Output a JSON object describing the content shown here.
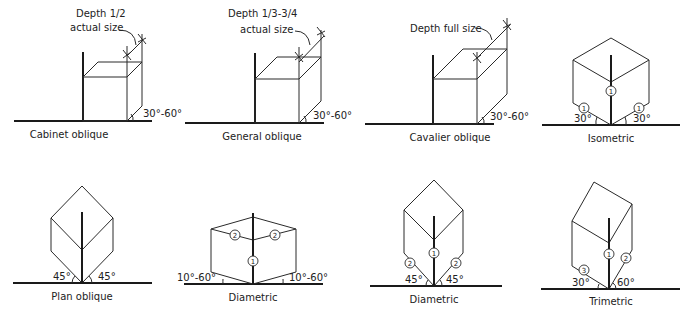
{
  "figures": [
    {
      "id": "cabinet",
      "caption": "Cabinet oblique",
      "note_line1": "Depth 1/2",
      "note_line2": "actual size",
      "angle": "30°-60°"
    },
    {
      "id": "general",
      "caption": "General oblique",
      "note_line1": "Depth 1/3-3/4",
      "note_line2": "actual size",
      "angle": "30°-60°"
    },
    {
      "id": "cavalier",
      "caption": "Cavalier oblique",
      "note_line1": "Depth full size",
      "angle": "30°-60°"
    },
    {
      "id": "isometric",
      "caption": "Isometric",
      "angle_left": "30°",
      "angle_right": "30°",
      "scale_vertical": "1",
      "scale_left": "1",
      "scale_right": "1"
    },
    {
      "id": "plan",
      "caption": "Plan oblique",
      "angle_left": "45°",
      "angle_right": "45°"
    },
    {
      "id": "diametric1",
      "caption": "Diametric",
      "angle_left": "10°-60°",
      "angle_right": "10°-60°",
      "scale_vertical": "1",
      "scale_left": "2",
      "scale_right": "2"
    },
    {
      "id": "diametric2",
      "caption": "Diametric",
      "angle_left": "45°",
      "angle_right": "45°",
      "scale_vertical": "1",
      "scale_left": "2",
      "scale_right": "2"
    },
    {
      "id": "trimetric",
      "caption": "Trimetric",
      "angle_left": "30°",
      "angle_right": "60°",
      "scale_vertical": "1",
      "scale_left": "3",
      "scale_right": "2"
    }
  ]
}
